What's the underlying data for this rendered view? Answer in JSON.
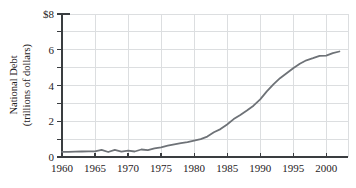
{
  "figure": {
    "background": "#ffffff"
  },
  "chart_data": {
    "type": "line",
    "title": "",
    "xlabel": "",
    "ylabel": "National Debt (trillions of dollars)",
    "ylabel_line1": "National Debt",
    "ylabel_line2": "(trillions of dollars)",
    "xlim": [
      1960,
      2003.3
    ],
    "ylim": [
      0,
      8
    ],
    "x_ticks": [
      1960,
      1965,
      1970,
      1975,
      1980,
      1985,
      1990,
      1995,
      2000
    ],
    "y_ticks": [
      {
        "value": 0,
        "label": "0"
      },
      {
        "value": 2,
        "label": "2"
      },
      {
        "value": 4,
        "label": "4"
      },
      {
        "value": 6,
        "label": "6"
      },
      {
        "value": 8,
        "label": "$8"
      }
    ],
    "y_minor_ticks": [
      1,
      3,
      5,
      7
    ],
    "grid": true,
    "legend_position": "none",
    "series": [
      {
        "name": "National Debt",
        "x": [
          1960,
          1961,
          1962,
          1963,
          1964,
          1965,
          1966,
          1967,
          1968,
          1969,
          1970,
          1971,
          1972,
          1973,
          1974,
          1975,
          1976,
          1977,
          1978,
          1979,
          1980,
          1981,
          1982,
          1983,
          1984,
          1985,
          1986,
          1987,
          1988,
          1989,
          1990,
          1991,
          1992,
          1993,
          1994,
          1995,
          1996,
          1997,
          1998,
          1999,
          2000,
          2001,
          2002
        ],
        "y": [
          0.29,
          0.29,
          0.3,
          0.31,
          0.32,
          0.32,
          0.4,
          0.28,
          0.4,
          0.3,
          0.36,
          0.31,
          0.42,
          0.38,
          0.48,
          0.54,
          0.63,
          0.71,
          0.78,
          0.83,
          0.91,
          1.0,
          1.14,
          1.38,
          1.56,
          1.82,
          2.12,
          2.35,
          2.6,
          2.87,
          3.23,
          3.67,
          4.06,
          4.41,
          4.69,
          4.97,
          5.22,
          5.41,
          5.53,
          5.66,
          5.67,
          5.81,
          5.9
        ]
      }
    ],
    "colors": {
      "background": "#ffffff",
      "line": "#6e7277",
      "grid": "#dcdee0",
      "axis": "#3a3d40",
      "text": "#1f2224"
    }
  }
}
